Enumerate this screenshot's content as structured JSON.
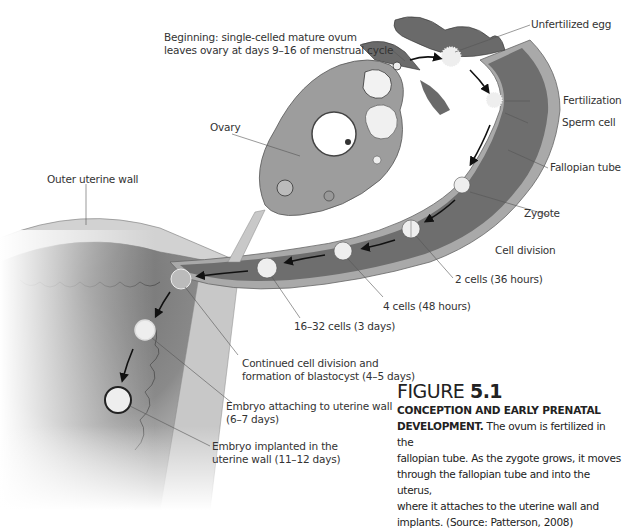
{
  "labels": {
    "beginning_line1": "Beginning: single-celled mature ovum",
    "beginning_line2": "leaves ovary at days 9–16 of menstrual cycle",
    "unfertilized_egg": "Unfertilized egg",
    "fertilization": "Fertilization",
    "sperm_cell": "Sperm cell",
    "fallopian_tube": "Fallopian tube",
    "zygote": "Zygote",
    "cell_division": "Cell division",
    "two_cells": "2 cells (36 hours)",
    "four_cells": "4 cells (48 hours)",
    "sixteen_cells": "16–32 cells (3 days)",
    "ovary": "Ovary",
    "outer_uterine_wall": "Outer uterine wall",
    "blastocyst_line1": "Continued cell division and",
    "blastocyst_line2": "formation of blastocyst (4–5 days)",
    "attaching_line1": "Embryo attaching to uterine wall",
    "attaching_line2": "(6–7 days)",
    "implanted_line1": "Embryo implanted in the",
    "implanted_line2": "uterine wall (11–12 days)"
  },
  "caption": {
    "figure_word": "FIGURE ",
    "figure_number": "5.1",
    "heading_line1": "CONCEPTION AND EARLY PRENATAL",
    "heading_line2": "DEVELOPMENT.",
    "body_first": " The ovum is fertilized in the",
    "body_lines": [
      "fallopian tube. As the zygote grows, it moves",
      "through the fallopian tube and into the uterus,",
      "where it attaches to the uterine wall and",
      "implants. (Source: Patterson, 2008)"
    ]
  },
  "colors": {
    "tube_dark": "#6e6e6e",
    "tube_wall": "#a9a9a9",
    "ovary": "#9d9d9d",
    "uterus_wall": "#c9c9c9",
    "cell_fill": "#eeeeee"
  }
}
